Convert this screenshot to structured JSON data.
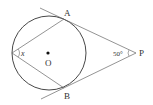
{
  "diagram": {
    "type": "geometry",
    "labels": {
      "A": "A",
      "B": "B",
      "O": "O",
      "P": "P",
      "x": "x",
      "angle_P": "50°"
    },
    "colors": {
      "line": "#555555",
      "circle": "#333333",
      "text": "#333333"
    }
  }
}
